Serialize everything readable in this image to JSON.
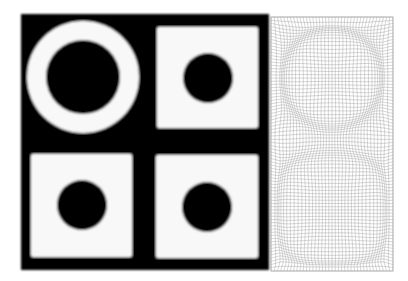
{
  "figure": {
    "colors": {
      "background": "#ffffff",
      "phantom_black": "#000000",
      "phantom_white": "#f8f8f8",
      "mesh_line": "#9a9a9a",
      "mesh_dense": "#7a7a7a"
    },
    "phantom": {
      "frame": {
        "x": 21,
        "y": 14,
        "w": 248,
        "h": 256
      },
      "ring": {
        "cx": 83,
        "cy": 77,
        "r_outer": 56,
        "r_inner": 37
      },
      "squares": [
        {
          "name": "top-right",
          "x": 157,
          "y": 27,
          "w": 101,
          "h": 101,
          "hole": {
            "cx": 208,
            "cy": 78,
            "r": 25
          }
        },
        {
          "name": "bottom-left",
          "x": 31,
          "y": 154,
          "w": 101,
          "h": 103,
          "hole": {
            "cx": 82,
            "cy": 205,
            "r": 25
          }
        },
        {
          "name": "bottom-right",
          "x": 156,
          "y": 155,
          "w": 102,
          "h": 103,
          "hole": {
            "cx": 207,
            "cy": 207,
            "r": 25
          }
        }
      ]
    },
    "mesh": {
      "frame": {
        "x": 271,
        "y": 17,
        "w": 122,
        "h": 254
      },
      "grid_step": 3.2,
      "top_ring": {
        "cx": 332,
        "cy": 78,
        "r_outer": 58,
        "r_inner": 42
      },
      "bottom_shape": {
        "cx": 332,
        "cy": 210,
        "r": 55
      }
    }
  }
}
